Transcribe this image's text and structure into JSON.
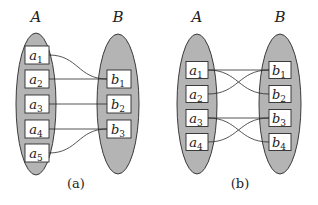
{
  "colors": {
    "ellipse_fill": "#b4b4b4",
    "stroke": "#2a2a2a",
    "box_fill": "#ffffff"
  },
  "diagrams": [
    {
      "caption": "(a)",
      "left_set": {
        "label": "A",
        "cx": 36,
        "cy": 104,
        "rx": 20,
        "ry": 71
      },
      "right_set": {
        "label": "B",
        "cx": 118,
        "cy": 104,
        "rx": 21,
        "ry": 70
      },
      "label_y": 22,
      "caption_pos": [
        76,
        188
      ],
      "box_w": 24,
      "box_h": 18,
      "left_box_x": 25,
      "right_box_x": 107,
      "left_nodes": [
        {
          "base": "a",
          "sub": "1",
          "cy": 55
        },
        {
          "base": "a",
          "sub": "2",
          "cy": 79
        },
        {
          "base": "a",
          "sub": "3",
          "cy": 104
        },
        {
          "base": "a",
          "sub": "4",
          "cy": 129
        },
        {
          "base": "a",
          "sub": "5",
          "cy": 153
        }
      ],
      "right_nodes": [
        {
          "base": "b",
          "sub": "1",
          "cy": 79
        },
        {
          "base": "b",
          "sub": "2",
          "cy": 104
        },
        {
          "base": "b",
          "sub": "3",
          "cy": 129
        }
      ],
      "edges": [
        {
          "from": "a1",
          "to": "b1"
        },
        {
          "from": "a2",
          "to": "b1"
        },
        {
          "from": "a3",
          "to": "b2"
        },
        {
          "from": "a4",
          "to": "b3"
        },
        {
          "from": "a5",
          "to": "b3"
        }
      ]
    },
    {
      "caption": "(b)",
      "left_set": {
        "label": "A",
        "cx": 197,
        "cy": 104,
        "rx": 20,
        "ry": 70
      },
      "right_set": {
        "label": "B",
        "cx": 280,
        "cy": 104,
        "rx": 21,
        "ry": 70
      },
      "label_y": 22,
      "caption_pos": [
        240,
        188
      ],
      "box_w": 22,
      "box_h": 17,
      "left_box_x": 186,
      "right_box_x": 269,
      "left_nodes": [
        {
          "base": "a",
          "sub": "1",
          "cy": 70
        },
        {
          "base": "a",
          "sub": "2",
          "cy": 94
        },
        {
          "base": "a",
          "sub": "3",
          "cy": 118
        },
        {
          "base": "a",
          "sub": "4",
          "cy": 142
        }
      ],
      "right_nodes": [
        {
          "base": "b",
          "sub": "1",
          "cy": 70
        },
        {
          "base": "b",
          "sub": "2",
          "cy": 94
        },
        {
          "base": "b",
          "sub": "3",
          "cy": 118
        },
        {
          "base": "b",
          "sub": "4",
          "cy": 142
        }
      ],
      "edges": [
        {
          "from": "a1",
          "to": "b1"
        },
        {
          "from": "a1",
          "to": "b2"
        },
        {
          "from": "a2",
          "to": "b1"
        },
        {
          "from": "a3",
          "to": "b3"
        },
        {
          "from": "a3",
          "to": "b4"
        },
        {
          "from": "a4",
          "to": "b3"
        }
      ]
    }
  ]
}
